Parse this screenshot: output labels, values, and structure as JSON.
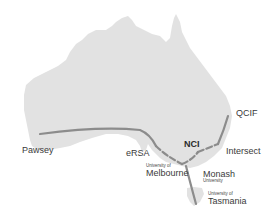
{
  "map": {
    "region": "Australia",
    "land_color": "#e2e2e2",
    "line_color": "#8c8c8c",
    "nodes": [
      {
        "id": "pawsey",
        "label": "Pawsey"
      },
      {
        "id": "ersa",
        "label": "eRSA"
      },
      {
        "id": "nci",
        "label": "NCI"
      },
      {
        "id": "qcif",
        "label": "QCIF"
      },
      {
        "id": "intersect",
        "label": "Intersect"
      },
      {
        "id": "melbourne",
        "prefix": "University of",
        "label": "Melbourne"
      },
      {
        "id": "monash",
        "label": "Monash",
        "suffix": "University"
      },
      {
        "id": "tasmania",
        "prefix": "University of",
        "label": "Tasmania"
      }
    ],
    "links": [
      {
        "from": "pawsey",
        "to": "ersa",
        "style": "solid"
      },
      {
        "from": "ersa",
        "to": "melbourne",
        "style": "dashed"
      },
      {
        "from": "melbourne",
        "to": "nci",
        "style": "dashed"
      },
      {
        "from": "nci",
        "to": "intersect",
        "style": "dashed"
      },
      {
        "from": "intersect",
        "to": "qcif",
        "style": "solid"
      },
      {
        "from": "melbourne",
        "to": "tasmania",
        "style": "solid"
      }
    ]
  }
}
